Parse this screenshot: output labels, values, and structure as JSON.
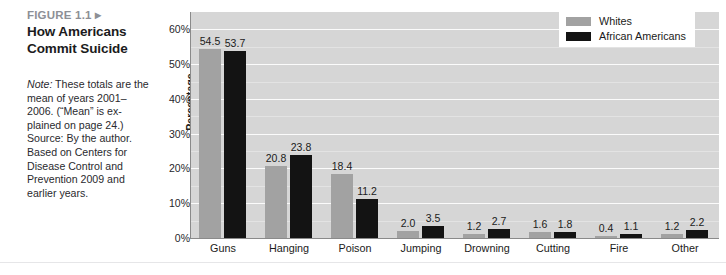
{
  "caption": {
    "figure_number": "FIGURE 1.1 ▸",
    "title": "How Americans Commit Suicide",
    "note": "Note: These totals are the mean of years 2001–2006. (“Mean” is explained on page 24.)",
    "note_lead": "Note:",
    "note_body": " These totals are the mean of years 2001–2006. (“Mean” is ex-plained on page 24.)",
    "source_lead": "Source:",
    "source_body": " By the author. Based on Centers for Disease Control and Prevention 2009 and earlier years."
  },
  "colors": {
    "whites": "#a2a2a2",
    "african_americans": "#131313",
    "plot_background": "#d6d6d6",
    "gridline": "#fbfbfb",
    "figure_number": "#8d8f96"
  },
  "chart_data": {
    "type": "bar",
    "title": "How Americans Commit Suicide",
    "xlabel": "",
    "ylabel": "Percentage",
    "ylim": [
      0,
      65
    ],
    "grid": true,
    "legend_position": "top-right",
    "y_ticks": [
      "0%",
      "10%",
      "20%",
      "30%",
      "40%",
      "50%",
      "60%"
    ],
    "y_tick_values": [
      0,
      10,
      20,
      30,
      40,
      50,
      60
    ],
    "categories": [
      "Guns",
      "Hanging",
      "Poison",
      "Jumping",
      "Drowning",
      "Cutting",
      "Fire",
      "Other"
    ],
    "series": [
      {
        "name": "Whites",
        "color": "#a2a2a2",
        "values": [
          54.5,
          20.8,
          18.4,
          2.0,
          1.2,
          1.6,
          0.4,
          1.2
        ],
        "labels": [
          "54.5",
          "20.8",
          "18.4",
          "2.0",
          "1.2",
          "1.6",
          "0.4",
          "1.2"
        ]
      },
      {
        "name": "African Americans",
        "color": "#131313",
        "values": [
          53.7,
          23.8,
          11.2,
          3.5,
          2.7,
          1.8,
          1.1,
          2.2
        ],
        "labels": [
          "53.7",
          "23.8",
          "11.2",
          "3.5",
          "2.7",
          "1.8",
          "1.1",
          "2.2"
        ]
      }
    ]
  }
}
